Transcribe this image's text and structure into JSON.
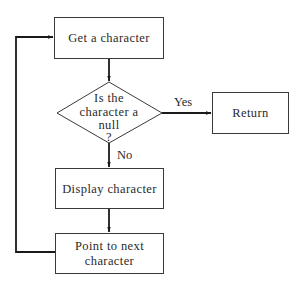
{
  "diagram": {
    "type": "flowchart",
    "nodes": {
      "get_char": {
        "kind": "process",
        "lines": [
          "Get a character"
        ]
      },
      "is_null": {
        "kind": "decision",
        "lines": [
          "Is the",
          "character a",
          "null",
          "?"
        ]
      },
      "return": {
        "kind": "process",
        "lines": [
          "Return"
        ]
      },
      "display": {
        "kind": "process",
        "lines": [
          "Display character"
        ]
      },
      "point_next": {
        "kind": "process",
        "lines": [
          "Point to next",
          "character"
        ]
      }
    },
    "edges": [
      {
        "from": "get_char",
        "to": "is_null",
        "label": ""
      },
      {
        "from": "is_null",
        "to": "return",
        "label": "Yes"
      },
      {
        "from": "is_null",
        "to": "display",
        "label": "No"
      },
      {
        "from": "display",
        "to": "point_next",
        "label": ""
      },
      {
        "from": "point_next",
        "to": "get_char",
        "label": ""
      }
    ],
    "edge_labels": {
      "yes": "Yes",
      "no": "No"
    }
  }
}
